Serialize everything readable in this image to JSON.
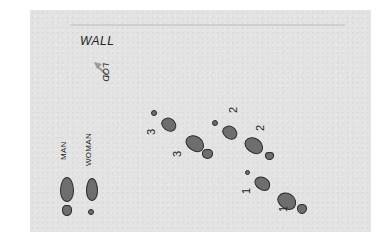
{
  "diagram": {
    "wall_label": "WALL",
    "lod_label": "LOD",
    "lod_arrow_icon": "arrow-up-left-icon",
    "legend": {
      "man_label": "MAN",
      "woman_label": "WOMAN"
    },
    "steps": [
      {
        "number": "1",
        "role": "man"
      },
      {
        "number": "1",
        "role": "woman"
      },
      {
        "number": "2",
        "role": "man"
      },
      {
        "number": "2",
        "role": "woman"
      },
      {
        "number": "3",
        "role": "man"
      },
      {
        "number": "3",
        "role": "woman"
      }
    ],
    "colors": {
      "paper": "#e3e3e3",
      "footprint_fill": "#6e6e6e",
      "footprint_outline": "#2a2a2a",
      "arrow": "#9a9a9a",
      "text": "#222222"
    }
  }
}
